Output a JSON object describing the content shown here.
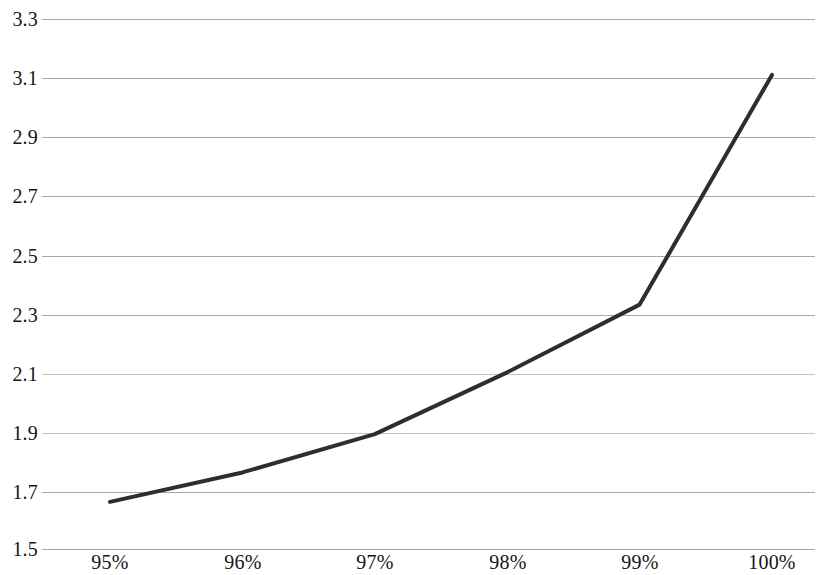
{
  "chart_data": {
    "type": "line",
    "title": "",
    "subtitle": "",
    "xlabel": "",
    "ylabel": "",
    "categories": [
      "95%",
      "96%",
      "97%",
      "98%",
      "99%",
      "100%"
    ],
    "x": [
      95,
      96,
      97,
      98,
      99,
      100
    ],
    "values": [
      1.66,
      1.76,
      1.89,
      2.1,
      2.33,
      3.11
    ],
    "series": [
      {
        "name": "",
        "values": [
          1.66,
          1.76,
          1.89,
          2.1,
          2.33,
          3.11
        ],
        "color": "#2e2e2e",
        "line_width": 4,
        "markers": false
      }
    ],
    "ylim": [
      1.5,
      3.3
    ],
    "ytick_step": 0.2,
    "ytick_labels": [
      "3.3",
      "3.1",
      "2.9",
      "2.7",
      "2.5",
      "2.3",
      "2.1",
      "1.9",
      "1.7",
      "1.5"
    ],
    "ytick_values": [
      3.3,
      3.1,
      2.9,
      2.7,
      2.5,
      2.3,
      2.1,
      1.9,
      1.7,
      1.5
    ],
    "xtick_labels": [
      "95%",
      "96%",
      "97%",
      "98%",
      "99%",
      "100%"
    ],
    "grid": {
      "horizontal": true,
      "vertical": false,
      "color": "#a8a8a8"
    },
    "legend": {
      "visible": false,
      "position": "none",
      "entries": []
    },
    "axis_line": {
      "visible": false
    },
    "background_color": "#ffffff",
    "annotations": []
  }
}
